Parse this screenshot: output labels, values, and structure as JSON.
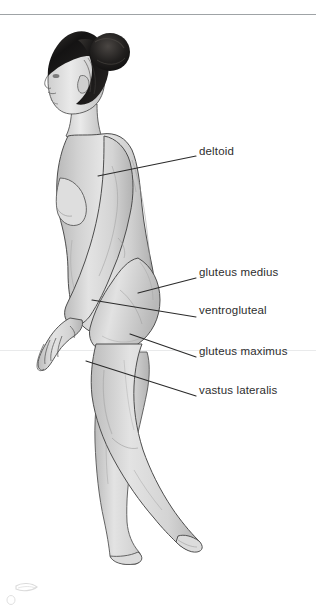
{
  "figure": {
    "skin_tone": "#d9d9d9",
    "outline_color": "#3c3c3c",
    "hair_color": "#1f1d1c",
    "background": "#ffffff",
    "top_rule_color": "#9fa3a6",
    "label_color": "#2e2e2e",
    "leader_color": "#2b2b2b"
  },
  "labels": [
    {
      "id": "deltoid",
      "text": "deltoid",
      "text_x": 199,
      "text_y": 152,
      "leader": {
        "x1": 98,
        "y1": 176,
        "x2": 196,
        "y2": 156
      }
    },
    {
      "id": "gluteus-medius",
      "text": "gluteus medius",
      "text_x": 199,
      "text_y": 273,
      "leader": {
        "x1": 138,
        "y1": 293,
        "x2": 196,
        "y2": 278
      }
    },
    {
      "id": "ventrogluteal",
      "text": "ventrogluteal",
      "text_x": 199,
      "text_y": 311,
      "leader": {
        "x1": 92,
        "y1": 300,
        "x2": 196,
        "y2": 317
      }
    },
    {
      "id": "gluteus-maximus",
      "text": "gluteus maximus",
      "text_x": 199,
      "text_y": 352,
      "leader": {
        "x1": 130,
        "y1": 334,
        "x2": 196,
        "y2": 357
      }
    },
    {
      "id": "vastus-lateralis",
      "text": "vastus lateralis",
      "text_x": 199,
      "text_y": 391,
      "leader": {
        "x1": 86,
        "y1": 361,
        "x2": 196,
        "y2": 396
      }
    }
  ],
  "rules": {
    "top_rule_y": 14,
    "seam_rule_y": 350
  },
  "watermark": {
    "present": true,
    "description": "faint light-gray mark in lower-left corner"
  }
}
